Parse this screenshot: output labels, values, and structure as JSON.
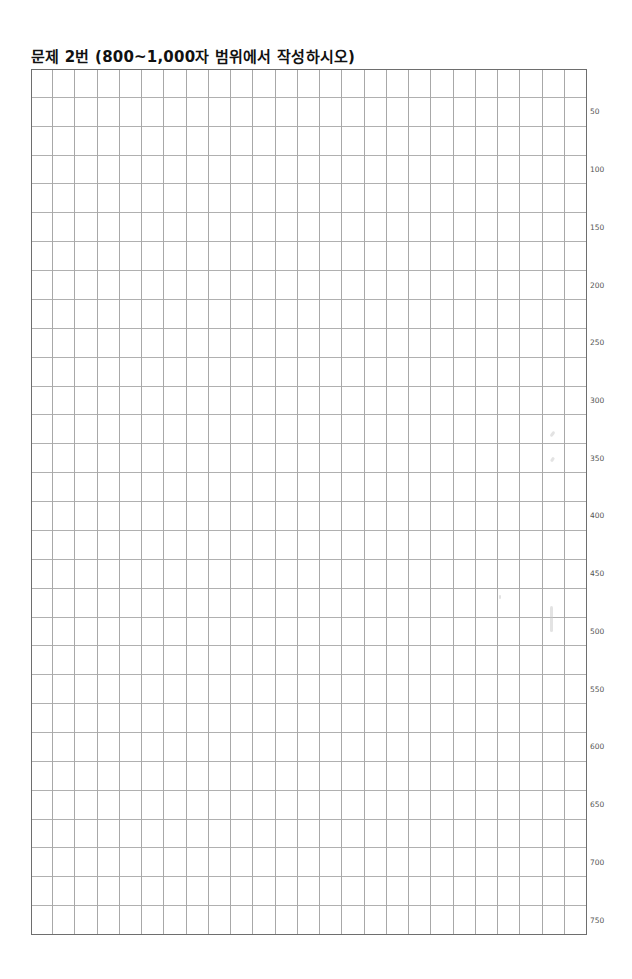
{
  "title": "문제 2번 (800~1,000자 범위에서 작성하시오)",
  "grid": {
    "columns": 25,
    "rows": 30,
    "characters_per_row": 25,
    "total_characters": 750,
    "line_color": "#a8a8a8",
    "border_color": "#6e6e6e"
  },
  "row_labels": [
    "50",
    "100",
    "150",
    "200",
    "250",
    "300",
    "350",
    "400",
    "450",
    "500",
    "550",
    "600",
    "650",
    "700",
    "750"
  ]
}
